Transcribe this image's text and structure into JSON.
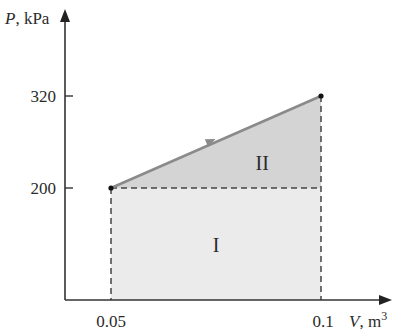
{
  "diagram": {
    "type": "P-V diagram",
    "y_axis": {
      "symbol": "P",
      "unit": "kPa",
      "label": "P, kPa"
    },
    "x_axis": {
      "symbol": "V",
      "unit": "m",
      "unit_exponent": "3",
      "label": "V, m3"
    },
    "y_ticks": [
      {
        "value": 200,
        "label": "200"
      },
      {
        "value": 320,
        "label": "320"
      }
    ],
    "x_ticks": [
      {
        "value": 0.05,
        "label": "0.05"
      },
      {
        "value": 0.1,
        "label": "0.1"
      }
    ],
    "states": [
      {
        "V": 0.05,
        "P": 200
      },
      {
        "V": 0.1,
        "P": 320
      }
    ],
    "process_direction": "from state 1 to state 2",
    "regions": [
      {
        "label": "I",
        "description": "rectangle under P=200 from V=0.05 to V=0.1",
        "color": "#ebebeb"
      },
      {
        "label": "II",
        "description": "triangle between process line and P=200",
        "color": "#d4d4d4"
      }
    ],
    "colors": {
      "axis": "#333333",
      "process_line": "#8a8a8a",
      "dashes": "#444444"
    }
  }
}
